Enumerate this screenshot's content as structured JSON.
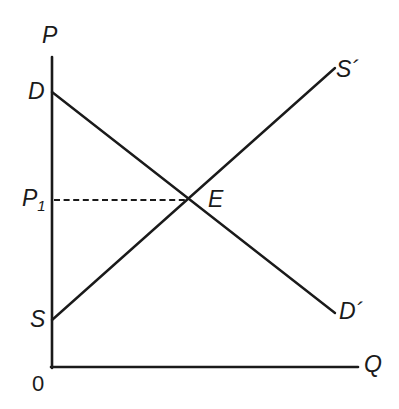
{
  "figure": {
    "kind": "supply-demand-diagram",
    "background_color": "#ffffff",
    "ink_color": "#1a1a1a",
    "width": 399,
    "height": 409
  },
  "axes": {
    "vertical": {
      "label": "P",
      "label_name": "price-axis-label",
      "x": 52,
      "y_top": 57,
      "y_bottom": 367
    },
    "horizontal": {
      "label": "Q",
      "label_name": "quantity-axis-label",
      "y": 367,
      "x_left": 52,
      "x_right": 358
    },
    "origin": {
      "label": "0",
      "x": 52,
      "y": 367
    }
  },
  "curves": [
    {
      "id": "demand",
      "start_label": "D",
      "end_label": "D´",
      "start_point": [
        52,
        92
      ],
      "end_point": [
        335,
        313
      ],
      "slope": "downward"
    },
    {
      "id": "supply",
      "start_label": "S",
      "end_label": "S´",
      "start_point": [
        52,
        320
      ],
      "end_point": [
        335,
        68
      ],
      "slope": "upward"
    }
  ],
  "equilibrium": {
    "point_label": "E",
    "point": [
      189,
      200
    ],
    "price_label_base": "P",
    "price_label_sub": "1",
    "guide_line": {
      "style": "dashed",
      "from": [
        54,
        200
      ],
      "to": [
        188,
        200
      ]
    }
  },
  "labels": {
    "price_axis": "P",
    "quantity_axis": "Q",
    "origin": "0",
    "demand_start": "D",
    "demand_end": "D´",
    "supply_start": "S",
    "supply_end": "S´",
    "equilibrium": "E",
    "equilibrium_price": "P",
    "equilibrium_price_sub": "1"
  },
  "chart_data": {
    "type": "line",
    "title": "",
    "xlabel": "Q",
    "ylabel": "P",
    "xlim": [
      0,
      100
    ],
    "ylim": [
      0,
      100
    ],
    "grid": false,
    "legend": "none",
    "series": [
      {
        "name": "D–D´ (Demand)",
        "x": [
          0,
          100
        ],
        "y": [
          88.7,
          17.4
        ],
        "start_annotation": "D",
        "end_annotation": "D´"
      },
      {
        "name": "S–S´ (Supply)",
        "x": [
          0,
          100
        ],
        "y": [
          15.2,
          96.5
        ],
        "start_annotation": "S",
        "end_annotation": "S´"
      }
    ],
    "annotations": [
      {
        "label": "E",
        "x": 48.4,
        "y": 54.2,
        "note": "equilibrium intersection of demand and supply"
      },
      {
        "label": "P₁",
        "x": 0,
        "y": 54.2,
        "note": "equilibrium price on vertical axis, dashed guide to E"
      },
      {
        "label": "0",
        "x": 0,
        "y": 0,
        "note": "origin"
      }
    ]
  }
}
